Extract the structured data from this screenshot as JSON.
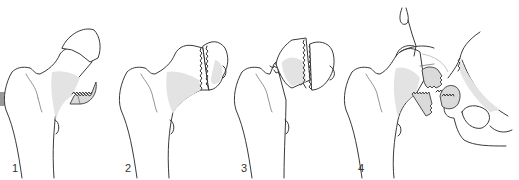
{
  "figure": {
    "panels": [
      {
        "id": 1,
        "label": "1",
        "stage": "incomplete impacted fracture"
      },
      {
        "id": 2,
        "label": "2",
        "stage": "complete non-displaced fracture"
      },
      {
        "id": 3,
        "label": "3",
        "stage": "complete partially displaced fracture"
      },
      {
        "id": 4,
        "label": "4",
        "stage": "complete fully displaced fracture"
      }
    ]
  },
  "colors": {
    "background": "#ffffff",
    "outline": "#3a3a3a",
    "shading": "#e3e3e3",
    "fragment": "#dadada"
  }
}
